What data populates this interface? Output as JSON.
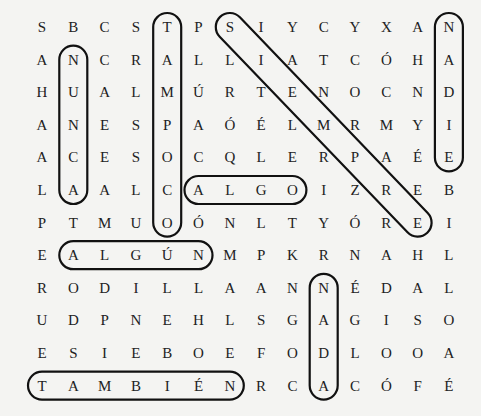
{
  "puzzle": {
    "type": "word-search",
    "columns": 14,
    "rows": 12,
    "grid": [
      [
        "S",
        "B",
        "C",
        "S",
        "T",
        "P",
        "S",
        "I",
        "Y",
        "C",
        "Y",
        "X",
        "A",
        "N"
      ],
      [
        "A",
        "N",
        "C",
        "R",
        "A",
        "L",
        "L",
        "I",
        "A",
        "T",
        "C",
        "Ó",
        "H",
        "A"
      ],
      [
        "H",
        "U",
        "A",
        "L",
        "M",
        "Ú",
        "R",
        "T",
        "E",
        "N",
        "O",
        "C",
        "N",
        "D"
      ],
      [
        "A",
        "N",
        "E",
        "S",
        "P",
        "A",
        "Ó",
        "É",
        "L",
        "M",
        "R",
        "M",
        "Y",
        "I"
      ],
      [
        "A",
        "C",
        "E",
        "S",
        "O",
        "C",
        "Q",
        "L",
        "E",
        "R",
        "P",
        "A",
        "É",
        "E"
      ],
      [
        "L",
        "A",
        "A",
        "L",
        "C",
        "A",
        "L",
        "G",
        "O",
        "I",
        "Z",
        "R",
        "E",
        "B"
      ],
      [
        "P",
        "T",
        "M",
        "U",
        "O",
        "Ó",
        "N",
        "L",
        "T",
        "Y",
        "Ó",
        "R",
        "E",
        "I"
      ],
      [
        "E",
        "A",
        "L",
        "G",
        "Ú",
        "N",
        "M",
        "P",
        "K",
        "R",
        "N",
        "A",
        "H",
        "L"
      ],
      [
        "R",
        "O",
        "D",
        "I",
        "L",
        "L",
        "A",
        "A",
        "N",
        "N",
        "É",
        "D",
        "A",
        "L"
      ],
      [
        "U",
        "D",
        "P",
        "N",
        "E",
        "H",
        "L",
        "S",
        "G",
        "A",
        "G",
        "I",
        "S",
        "O"
      ],
      [
        "E",
        "S",
        "I",
        "E",
        "B",
        "O",
        "E",
        "F",
        "O",
        "D",
        "L",
        "O",
        "O",
        "A"
      ],
      [
        "T",
        "A",
        "M",
        "B",
        "I",
        "É",
        "N",
        "R",
        "C",
        "A",
        "C",
        "Ó",
        "F",
        "É"
      ]
    ],
    "found_words": [
      {
        "word": "NUNCA",
        "direction": "vertical",
        "start": [
          2,
          2
        ],
        "end": [
          6,
          2
        ]
      },
      {
        "word": "TAMPOCO",
        "direction": "vertical",
        "start": [
          1,
          5
        ],
        "end": [
          7,
          5
        ]
      },
      {
        "word": "SIEMPRE",
        "direction": "diagonal",
        "start": [
          1,
          7
        ],
        "end": [
          7,
          13
        ]
      },
      {
        "word": "NADIE",
        "direction": "vertical",
        "start": [
          1,
          14
        ],
        "end": [
          5,
          14
        ]
      },
      {
        "word": "ALGO",
        "direction": "horizontal",
        "start": [
          6,
          6
        ],
        "end": [
          6,
          9
        ]
      },
      {
        "word": "ALGÚN",
        "direction": "horizontal",
        "start": [
          8,
          2
        ],
        "end": [
          8,
          6
        ]
      },
      {
        "word": "NADA",
        "direction": "vertical",
        "start": [
          9,
          10
        ],
        "end": [
          12,
          10
        ]
      },
      {
        "word": "TAMBIÉN",
        "direction": "horizontal",
        "start": [
          12,
          1
        ],
        "end": [
          12,
          7
        ]
      }
    ]
  }
}
